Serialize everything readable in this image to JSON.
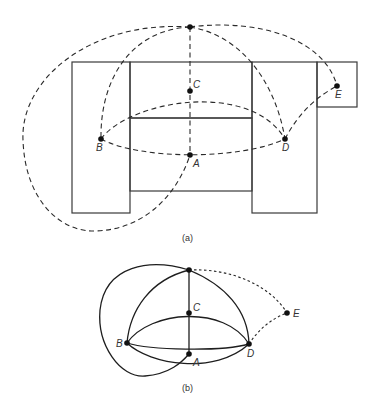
{
  "figure": {
    "part_a": {
      "caption": "(a)",
      "nodes": [
        {
          "id": "top",
          "label": "",
          "x": 190,
          "y": 27
        },
        {
          "id": "C",
          "label": "C",
          "x": 190,
          "y": 91
        },
        {
          "id": "B",
          "label": "B",
          "x": 101,
          "y": 139
        },
        {
          "id": "A",
          "label": "A",
          "x": 190,
          "y": 155
        },
        {
          "id": "D",
          "label": "D",
          "x": 285,
          "y": 139
        },
        {
          "id": "E",
          "label": "E",
          "x": 337,
          "y": 86
        }
      ],
      "rooms": [
        {
          "name": "left-wing",
          "x": 72,
          "y": 62,
          "w": 58,
          "h": 151
        },
        {
          "name": "center-upper",
          "x": 130,
          "y": 62,
          "w": 122,
          "h": 56
        },
        {
          "name": "center-lower",
          "x": 130,
          "y": 118,
          "w": 122,
          "h": 73
        },
        {
          "name": "right-wing",
          "x": 252,
          "y": 62,
          "w": 65,
          "h": 151
        },
        {
          "name": "annex",
          "x": 317,
          "y": 62,
          "w": 40,
          "h": 45
        }
      ],
      "edges": [
        "top-C",
        "C-A",
        "top-B",
        "top-D",
        "top-E",
        "B-C",
        "C-D",
        "B-A",
        "A-D",
        "D-E",
        "top-A(outer loop)"
      ],
      "edge_style": "dashed"
    },
    "part_b": {
      "caption": "(b)",
      "nodes": [
        {
          "id": "top",
          "label": "",
          "x": 189,
          "y": 270
        },
        {
          "id": "C",
          "label": "C",
          "x": 189,
          "y": 313
        },
        {
          "id": "B",
          "label": "B",
          "x": 127,
          "y": 343
        },
        {
          "id": "A",
          "label": "A",
          "x": 189,
          "y": 354
        },
        {
          "id": "D",
          "label": "D",
          "x": 249,
          "y": 344
        },
        {
          "id": "E",
          "label": "E",
          "x": 287,
          "y": 313
        }
      ],
      "edges": [
        "top-C",
        "C-A",
        "top-B",
        "top-D",
        "B-C",
        "C-D",
        "B-A",
        "A-D",
        "B-D",
        "top-A(outer loop)",
        "top-E(dashed)",
        "D-E(dashed)"
      ],
      "edge_style": "solid"
    }
  }
}
